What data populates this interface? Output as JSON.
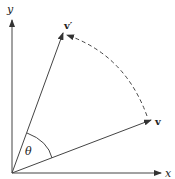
{
  "diagram": {
    "title": "",
    "axes": {
      "x_label": "x",
      "y_label": "y"
    },
    "vectors": [
      {
        "name": "v",
        "label": "v"
      },
      {
        "name": "v_prime",
        "label": "v′"
      }
    ],
    "angle": {
      "label": "θ"
    },
    "rotation_arc": {
      "style": "dashed",
      "direction": "from v to v′"
    },
    "colors": {
      "line": "#333333",
      "background": "#ffffff"
    }
  }
}
